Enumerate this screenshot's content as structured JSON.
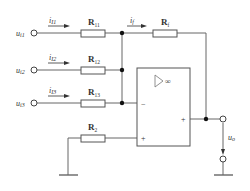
{
  "diagram": {
    "type": "circuit",
    "inputs": [
      {
        "voltage_label": "u",
        "voltage_sub": "i1",
        "current_label": "i",
        "current_sub": "I1",
        "resistor_label": "R",
        "resistor_sub": "11"
      },
      {
        "voltage_label": "u",
        "voltage_sub": "i2",
        "current_label": "i",
        "current_sub": "I2",
        "resistor_label": "R",
        "resistor_sub": "12"
      },
      {
        "voltage_label": "u",
        "voltage_sub": "i3",
        "current_label": "i",
        "current_sub": "I3",
        "resistor_label": "R",
        "resistor_sub": "13"
      }
    ],
    "feedback": {
      "current_label": "i",
      "current_sub": "f",
      "resistor_label": "R",
      "resistor_sub": "f"
    },
    "bias": {
      "resistor_label": "R",
      "resistor_sub": "2"
    },
    "opamp": {
      "symbol": "▷∞",
      "inverting": "−",
      "noninverting": "+",
      "output": "+"
    },
    "output": {
      "label": "u",
      "sub": "o"
    },
    "colors": {
      "wire": "#555555",
      "node": "#111111",
      "text": "#333333"
    }
  }
}
